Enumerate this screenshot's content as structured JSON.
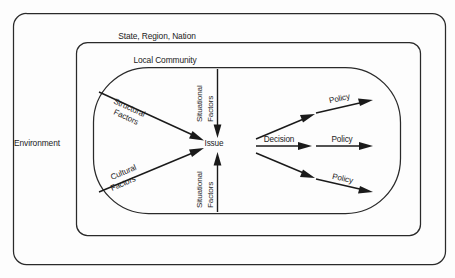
{
  "diagram": {
    "colors": {
      "stroke": "#2a2a2a",
      "arrow": "#1a1a1a",
      "text": "#1b1b1b",
      "background": "#fdfdfd"
    },
    "containers": [
      {
        "id": "environment",
        "label": "Environment"
      },
      {
        "id": "state-region-nation",
        "label": "State, Region, Nation"
      },
      {
        "id": "local-community",
        "label": "Local Community"
      }
    ],
    "nodes": [
      {
        "id": "issue",
        "label": "Issue"
      }
    ],
    "inputs": [
      {
        "id": "structural-factors",
        "line1": "Structural",
        "line2": "Factors"
      },
      {
        "id": "cultural-factors",
        "line1": "Cultural",
        "line2": "Factors"
      },
      {
        "id": "situational-factors-top",
        "line1": "Situational",
        "line2": "Factors"
      },
      {
        "id": "situational-factors-bottom",
        "line1": "Situational",
        "line2": "Factors"
      }
    ],
    "outputs": {
      "decision": "Decision",
      "policies": [
        {
          "id": "policy-upper",
          "label": "Policy"
        },
        {
          "id": "policy-middle",
          "label": "Policy"
        },
        {
          "id": "policy-lower",
          "label": "Policy"
        }
      ]
    }
  }
}
